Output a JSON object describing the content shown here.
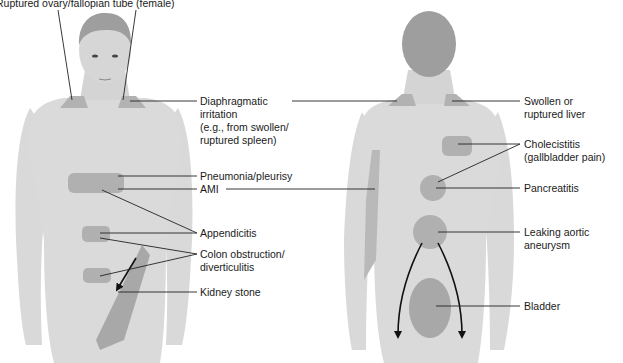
{
  "diagram": {
    "title_label": "Ruptured ovary/fallopian tube (female)",
    "colors": {
      "skin": "#d9d9d9",
      "skin_shadow": "#c9c9c9",
      "hair": "#9a9a9a",
      "pain_region": "#b0b0b0",
      "pain_region_dark": "#a3a3a3",
      "leader_line": "#222222",
      "text": "#1a1a1a"
    },
    "front_view": {
      "labels": {
        "diaphragmatic": [
          "Diaphragmatic",
          "irritation",
          "(e.g., from swollen/",
          "ruptured spleen)"
        ],
        "pneumonia": "Pneumonia/pleurisy",
        "ami": "AMI",
        "appendicitis": "Appendicitis",
        "colon": [
          "Colon obstruction/",
          "diverticulitis"
        ],
        "kidney": "Kidney stone"
      }
    },
    "back_view": {
      "labels": {
        "liver": [
          "Swollen or",
          "ruptured liver"
        ],
        "cholecistitis": [
          "Cholecistitis",
          "(gallbladder pain)"
        ],
        "pancreatitis": "Pancreatitis",
        "aortic": [
          "Leaking aortic",
          "aneurysm"
        ],
        "bladder": "Bladder"
      }
    }
  }
}
